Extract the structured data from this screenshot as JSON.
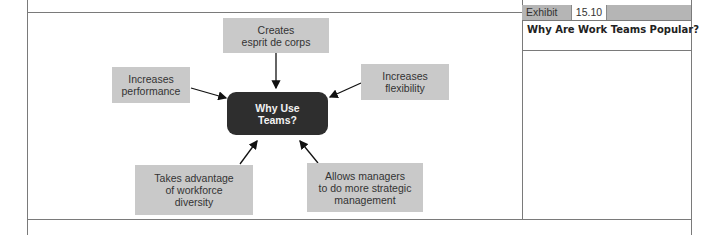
{
  "exhibit": {
    "label": "Exhibit",
    "number": "15.10",
    "title": "Why Are Work Teams Popular?"
  },
  "diagram": {
    "center": "Why Use\nTeams?",
    "nodes": [
      {
        "id": "top",
        "text": "Creates\nesprit de corps"
      },
      {
        "id": "left",
        "text": "Increases\nperformance"
      },
      {
        "id": "right",
        "text": "Increases\nflexibility"
      },
      {
        "id": "bottom-left",
        "text": "Takes advantage\nof workforce\ndiversity"
      },
      {
        "id": "bottom-right",
        "text": "Allows managers\nto do more strategic\nmanagement"
      }
    ]
  },
  "colors": {
    "node_fill": "#c9c9c9",
    "center_fill": "#2e2e2e",
    "center_text": "#f2f2f2",
    "frame_line": "#7a7a7a",
    "exhibit_bar": "#b5b5b5"
  }
}
